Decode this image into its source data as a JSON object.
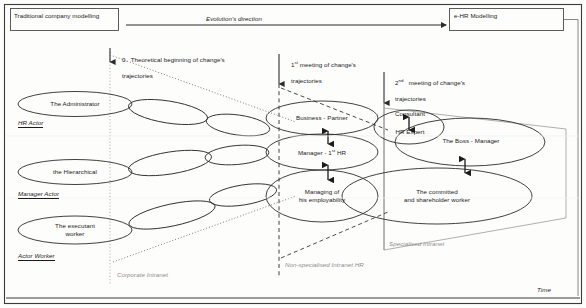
{
  "diagram": {
    "title_left": "Traditional company modelling",
    "title_right": "e-HR Modelling",
    "evolution_arrow_label": "Evolution's direction",
    "time_axis_label": "Time"
  },
  "milestones": [
    {
      "id": "m0",
      "line1": "0.  Theoretical beginning of change's",
      "line2": "trajectories"
    },
    {
      "id": "m1",
      "ordinal": "1",
      "sup": "st",
      "line1": " meeting of change's",
      "line2": "trajectories"
    },
    {
      "id": "m2",
      "ordinal": "2",
      "sup": "nd",
      "line1": "   meeting of change's",
      "line2": "trajectories"
    }
  ],
  "actor_lanes": [
    {
      "id": "hr",
      "axis_label": "HR Actor",
      "start_label": "The Administrator"
    },
    {
      "id": "manager",
      "axis_label": "Manager Actor",
      "start_label": "the Hierarchical"
    },
    {
      "id": "worker",
      "axis_label": "Actor Worker",
      "start_line1": "The executant",
      "start_line2": "worker"
    }
  ],
  "mid_states": [
    {
      "id": "business-partner",
      "text": "Business     -  Partner"
    },
    {
      "id": "manager-hr",
      "pre": "Manager    -  1",
      "sup": "st",
      "post": "  HR"
    },
    {
      "id": "employability",
      "line1": "Managing of",
      "line2": "his employability"
    }
  ],
  "end_states": [
    {
      "id": "consultant",
      "line1": "Consultant",
      "line2": "HR Expert"
    },
    {
      "id": "boss-manager",
      "text": "The Boss - Manager"
    },
    {
      "id": "committed-worker",
      "line1": "The committed",
      "line2": "and shareholder worker"
    }
  ],
  "intranet_zones": [
    {
      "id": "corporate",
      "label": "Corporate Intranet"
    },
    {
      "id": "non-specialised",
      "label": "Non-specialised Intranet HR"
    },
    {
      "id": "specialised",
      "label": "Specialised Intranet"
    }
  ],
  "colors": {
    "stroke": "#2b2b2b",
    "grey_guide": "#9a9a9a",
    "text": "#1b1b1b",
    "grey_text": "#8d8d8d"
  }
}
